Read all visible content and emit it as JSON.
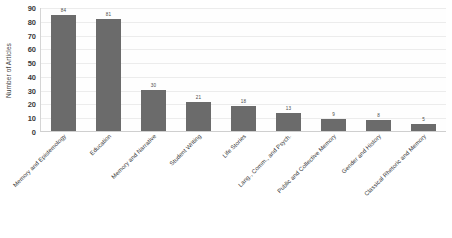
{
  "chart_data": {
    "type": "bar",
    "title": "",
    "xlabel": "",
    "ylabel": "Number of Articles",
    "ylim": [
      0,
      90
    ],
    "ytick_step": 10,
    "yticks": [
      0,
      10,
      20,
      30,
      40,
      50,
      60,
      70,
      80,
      90
    ],
    "grid": true,
    "legend": "none",
    "bar_color": "#6b6b6b",
    "categories": [
      "Memory and Epistemology",
      "Education",
      "Memory and Narrative",
      "Student Writing",
      "Life Stories",
      "Lang., Comm., and Psych.",
      "Public and Collective Memory",
      "Gender and History",
      "Classical Rhetoric and Memory"
    ],
    "values": [
      84,
      81,
      30,
      21,
      18,
      13,
      9,
      8,
      5
    ],
    "value_labels": [
      "84",
      "81",
      "30",
      "21",
      "18",
      "13",
      "9",
      "8",
      "5"
    ]
  }
}
